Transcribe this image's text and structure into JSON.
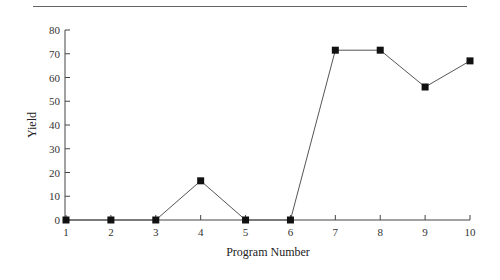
{
  "chart_data": {
    "type": "line",
    "title": "",
    "xlabel": "Program Number",
    "ylabel": "Yield",
    "x": [
      1,
      2,
      3,
      4,
      5,
      6,
      7,
      8,
      9,
      10
    ],
    "series": [
      {
        "name": "Yield",
        "values": [
          0,
          0,
          0,
          16.5,
          0,
          0,
          71.5,
          71.5,
          56,
          67
        ],
        "marker": "square",
        "color": "#111111"
      }
    ],
    "xticks": [
      "1",
      "2",
      "3",
      "4",
      "5",
      "6",
      "7",
      "8",
      "9",
      "10"
    ],
    "yticks": [
      "0",
      "10",
      "20",
      "30",
      "40",
      "50",
      "60",
      "70",
      "80"
    ],
    "xlim": [
      1,
      10
    ],
    "ylim": [
      0,
      80
    ],
    "grid": false,
    "legend": null
  },
  "colors": {
    "line": "#555555",
    "marker": "#111111",
    "axis": "#444444",
    "rule": "#666666"
  }
}
